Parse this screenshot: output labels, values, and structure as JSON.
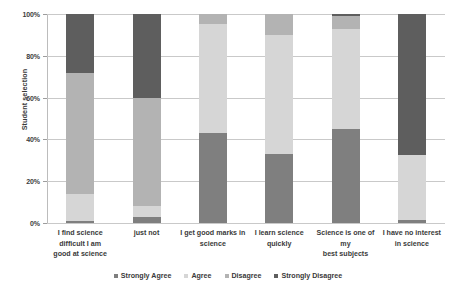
{
  "chart_data": {
    "type": "bar",
    "subtype": "stacked-100-percent",
    "title": "",
    "xlabel": "",
    "ylabel": "Student selection",
    "ylim": [
      0,
      100
    ],
    "yticks": [
      "0%",
      "20%",
      "40%",
      "60%",
      "80%",
      "100%"
    ],
    "ytick_values": [
      0,
      20,
      40,
      60,
      80,
      100
    ],
    "grid": true,
    "legend_position": "bottom",
    "categories": [
      "I find science difficult I am",
      "just not",
      "I get good marks in",
      "I learn science",
      "Science is one of my",
      "I have no interest"
    ],
    "category_labels": [
      [
        "I find science difficult I am",
        "good at science"
      ],
      [
        "just not",
        ""
      ],
      [
        "I get good marks in",
        "science"
      ],
      [
        "I learn science",
        "quickly"
      ],
      [
        "Science is one of my",
        "best subjects"
      ],
      [
        "I have no interest",
        "in science"
      ]
    ],
    "series": [
      {
        "name": "Strongly Agree",
        "color": "#7f7f7f",
        "values": [
          1,
          3,
          43,
          33,
          45,
          1.5
        ]
      },
      {
        "name": "Agree",
        "color": "#d6d6d6",
        "values": [
          13,
          5,
          52,
          57,
          48,
          31
        ]
      },
      {
        "name": "Disagree",
        "color": "#b3b3b3",
        "values": [
          58,
          52,
          5,
          10,
          6,
          0
        ]
      },
      {
        "name": "Strongly Disagree",
        "color": "#5e5e5e",
        "values": [
          28,
          40,
          0,
          0,
          1,
          67.5
        ]
      }
    ]
  },
  "legend": {
    "items": [
      {
        "label": "Strongly Agree",
        "color": "#7f7f7f"
      },
      {
        "label": "Agree",
        "color": "#d6d6d6"
      },
      {
        "label": "Disagree",
        "color": "#b3b3b3"
      },
      {
        "label": "Strongly Disagree",
        "color": "#5e5e5e"
      }
    ]
  },
  "axis": {
    "y_title": "Student selection"
  }
}
